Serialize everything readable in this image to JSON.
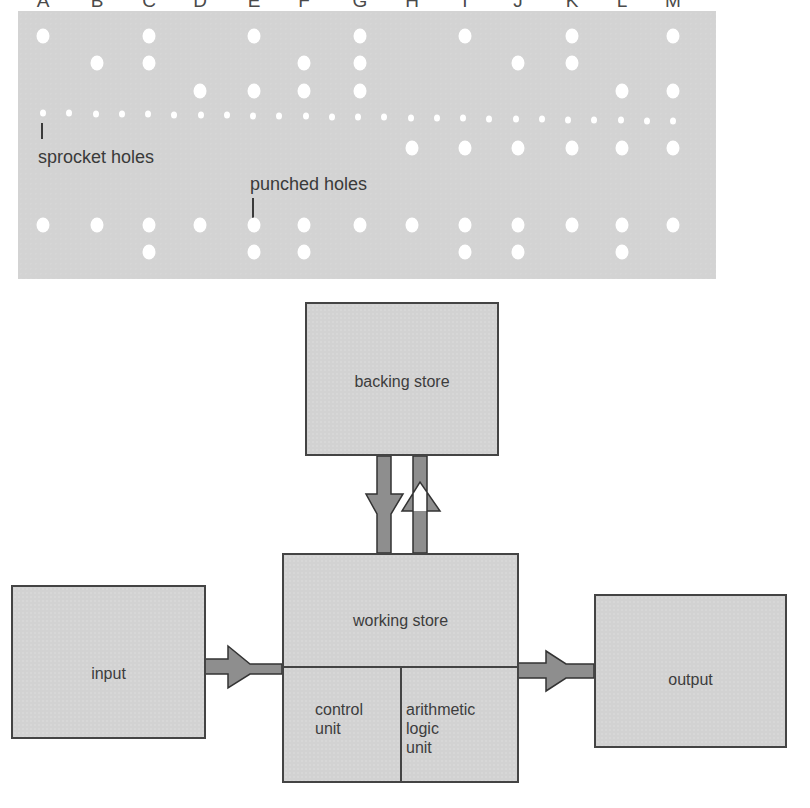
{
  "tape": {
    "columns": [
      "A",
      "B",
      "C",
      "D",
      "E",
      "F",
      "G",
      "H",
      "I",
      "J",
      "K",
      "L",
      "M"
    ],
    "column_x": [
      43,
      97,
      149,
      200,
      254,
      304,
      360,
      412,
      465,
      518,
      572,
      622,
      673
    ],
    "rows_above": [
      {
        "y": 36,
        "holes": [
          "A",
          "C",
          "E",
          "G",
          "I",
          "K",
          "M"
        ]
      },
      {
        "y": 63,
        "holes": [
          "B",
          "C",
          "F",
          "G",
          "J",
          "K"
        ]
      },
      {
        "y": 91,
        "holes": [
          "D",
          "E",
          "F",
          "G",
          "L",
          "M"
        ]
      }
    ],
    "sprocket_row_y": 117,
    "sprocket_count": 25,
    "rows_below": [
      {
        "y": 148,
        "holes": [
          "H",
          "I",
          "J",
          "K",
          "L",
          "M"
        ]
      },
      {
        "y": 225,
        "holes": [
          "A",
          "B",
          "C",
          "D",
          "E",
          "F",
          "G",
          "H",
          "I",
          "J",
          "K",
          "L",
          "M"
        ]
      },
      {
        "y": 252,
        "holes": [
          "C",
          "E",
          "F",
          "I",
          "J",
          "L"
        ]
      }
    ],
    "labels": {
      "sprocket": "sprocket holes",
      "punched": "punched holes"
    }
  },
  "diagram": {
    "backing_store": "backing store",
    "working_store": "working store",
    "control_unit": [
      "control",
      "unit"
    ],
    "alu": [
      "arithmetic",
      "logic",
      "unit"
    ],
    "input": "input",
    "output": "output"
  },
  "colors": {
    "tape": "#d3d3d3",
    "block": "#d2d2d2",
    "arrow": "#8e8e8e",
    "outline": "#444444"
  }
}
